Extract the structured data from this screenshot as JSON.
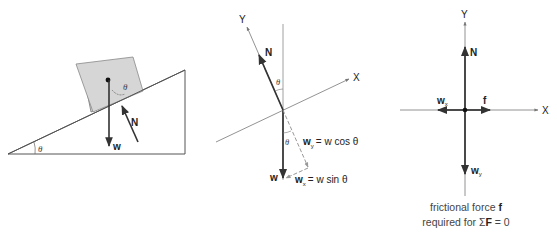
{
  "panels": {
    "incline": {
      "angle_label": "θ",
      "block_angle_label": "θ",
      "weight_label": "w",
      "normal_label": "N"
    },
    "rotated_axes": {
      "y_axis_label": "Y",
      "x_axis_label": "X",
      "normal_label": "N",
      "angle_label_top": "θ",
      "angle_label_bottom": "θ",
      "weight_label": "w",
      "wy_label": "w",
      "wy_sub": "y",
      "wy_eq": "= w cos θ",
      "wx_label": "w",
      "wx_sub": "x",
      "wx_eq": "= w sin θ"
    },
    "free_body": {
      "y_axis_label": "Y",
      "x_axis_label": "X",
      "normal_label": "N",
      "wx_label": "w",
      "wx_sub": "x",
      "f_label": "f",
      "wy_label": "w",
      "wy_sub": "y",
      "caption_line1_a": "frictional force ",
      "caption_line1_b": "f",
      "caption_line2_a": "required for Σ",
      "caption_line2_b": "F",
      "caption_line2_c": " = 0"
    }
  },
  "colors": {
    "line": "#333333",
    "thin": "#777777",
    "dashed": "#888888",
    "block_fill": "#d4d4d4"
  }
}
